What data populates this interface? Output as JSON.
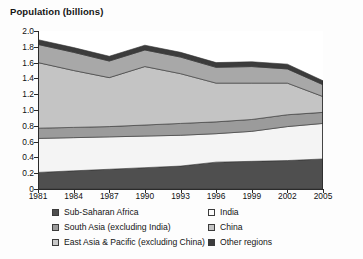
{
  "chart_data": {
    "type": "area",
    "title": "Population (billions)",
    "xlabel": "",
    "ylabel": "Population (billions)",
    "stacked": true,
    "grid": false,
    "legend_position": "bottom",
    "xlim": [
      1981,
      2005
    ],
    "ylim": [
      0,
      2.0
    ],
    "y_ticks": [
      "0",
      "0.2",
      "0.4",
      "0.6",
      "0.8",
      "1.0",
      "1.2",
      "1.4",
      "1.6",
      "1.8",
      "2.0"
    ],
    "y_tick_values": [
      0,
      0.2,
      0.4,
      0.6,
      0.8,
      1.0,
      1.2,
      1.4,
      1.6,
      1.8,
      2.0
    ],
    "x_ticks": [
      "1981",
      "1984",
      "1987",
      "1990",
      "1993",
      "1996",
      "1999",
      "2002",
      "2005"
    ],
    "x_tick_values": [
      1981,
      1984,
      1987,
      1990,
      1993,
      1996,
      1999,
      2002,
      2005
    ],
    "x": [
      1981,
      1984,
      1987,
      1990,
      1993,
      1996,
      1999,
      2002,
      2005
    ],
    "series": [
      {
        "name": "Sub-Saharan Africa",
        "color": "#4f4f4f",
        "values": [
          0.21,
          0.23,
          0.25,
          0.27,
          0.29,
          0.34,
          0.35,
          0.36,
          0.38
        ]
      },
      {
        "name": "India",
        "color": "#f4f4f4",
        "values": [
          0.43,
          0.42,
          0.41,
          0.4,
          0.39,
          0.36,
          0.38,
          0.43,
          0.45
        ]
      },
      {
        "name": "South Asia (excluding India)",
        "color": "#9b9b9b",
        "values": [
          0.13,
          0.13,
          0.13,
          0.14,
          0.15,
          0.15,
          0.15,
          0.15,
          0.14
        ]
      },
      {
        "name": "China",
        "color": "#c4c4c4",
        "values": [
          0.83,
          0.72,
          0.62,
          0.74,
          0.63,
          0.49,
          0.46,
          0.4,
          0.2
        ]
      },
      {
        "name": "East Asia & Pacific (excluding China)",
        "color": "#a8a8a8",
        "values": [
          0.23,
          0.23,
          0.21,
          0.21,
          0.21,
          0.2,
          0.21,
          0.18,
          0.15
        ]
      },
      {
        "name": "Other regions",
        "color": "#3c3c3c",
        "values": [
          0.06,
          0.06,
          0.06,
          0.06,
          0.06,
          0.06,
          0.06,
          0.06,
          0.05
        ]
      }
    ],
    "totals": [
      1.89,
      1.79,
      1.68,
      1.82,
      1.73,
      1.6,
      1.61,
      1.58,
      1.37
    ]
  },
  "legend": {
    "left_column": [
      {
        "label": "Sub-Saharan Africa",
        "color": "#4f4f4f"
      },
      {
        "label": "South Asia (excluding India)",
        "color": "#9b9b9b"
      },
      {
        "label": "East Asia & Pacific (excluding China)",
        "color": "#c9c9c9"
      }
    ],
    "right_column": [
      {
        "label": "India",
        "color": "#fbfbfb"
      },
      {
        "label": "China",
        "color": "#c4c4c4"
      },
      {
        "label": "Other regions",
        "color": "#3c3c3c"
      }
    ]
  }
}
